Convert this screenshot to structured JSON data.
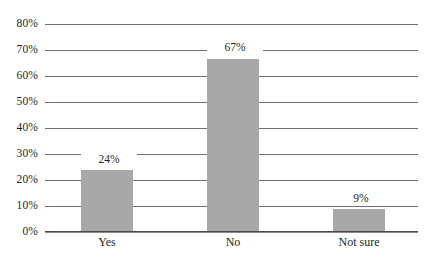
{
  "chart_data": {
    "type": "bar",
    "title": "",
    "subtitle": "",
    "xlabel": "",
    "ylabel": "",
    "categories": [
      "Yes",
      "No",
      "Not sure"
    ],
    "values": [
      24,
      67,
      9
    ],
    "value_labels": [
      "24%",
      "67%",
      "9%"
    ],
    "ylim": [
      0,
      80
    ],
    "ytick_values": [
      0,
      10,
      20,
      30,
      40,
      50,
      60,
      70,
      80
    ],
    "ytick_labels": [
      "0%",
      "10%",
      "20%",
      "30%",
      "40%",
      "50%",
      "60%",
      "70%",
      "80%"
    ],
    "grid": true,
    "legend": false,
    "legend_position": "none",
    "orientation": "vertical",
    "series": [
      {
        "name": "",
        "values": [
          24,
          67,
          9
        ]
      }
    ],
    "colors": {
      "bar_fill": "#a8a8a8",
      "gridline": "#6f6f6f",
      "axis_line": "#4a4a4a",
      "text": "#231f20",
      "background": "#ffffff"
    }
  }
}
